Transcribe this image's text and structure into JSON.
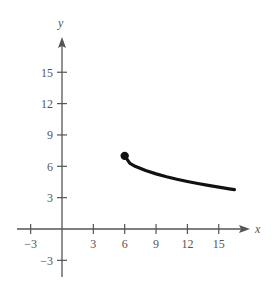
{
  "chart_data": {
    "type": "line",
    "title": "",
    "xlabel": "x",
    "ylabel": "y",
    "xlim": [
      -4,
      18
    ],
    "ylim": [
      -4.5,
      18
    ],
    "xticks": [
      -3,
      3,
      6,
      9,
      12,
      15
    ],
    "yticks": [
      -3,
      3,
      6,
      9,
      12,
      15
    ],
    "xtick_labels": [
      "−3",
      "3",
      "6",
      "9",
      "12",
      "15"
    ],
    "ytick_labels": [
      "−3",
      "3",
      "6",
      "9",
      "12",
      "15"
    ],
    "grid": false,
    "legend": null,
    "series": [
      {
        "name": "curve",
        "x": [
          6,
          6.5,
          7,
          8,
          9,
          10,
          11,
          12,
          13,
          14,
          15,
          16,
          16.5
        ],
        "y": [
          7,
          6.29,
          6,
          5.59,
          5.27,
          5,
          4.76,
          4.55,
          4.35,
          4.17,
          4,
          3.84,
          3.76
        ],
        "start_point": {
          "x": 6,
          "y": 7,
          "marker": "closed-dot"
        }
      }
    ],
    "colors": {
      "axis": "#555555",
      "curve": "#111111"
    }
  }
}
